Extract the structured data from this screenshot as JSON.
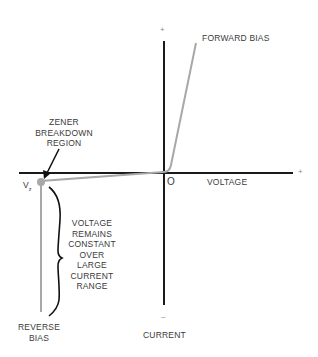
{
  "diagram": {
    "axes": {
      "x_label": "VOLTAGE",
      "y_label": "CURRENT",
      "origin_label": "O",
      "x_positive_sign": "+",
      "y_positive_sign": "+",
      "y_negative_sign": "–"
    },
    "labels": {
      "forward_bias": "FORWARD BIAS",
      "zener_region_line1": "ZENER",
      "zener_region_line2": "BREAKDOWN",
      "zener_region_line3": "REGION",
      "vz_main": "V",
      "vz_sub": "z",
      "constant_line1": "VOLTAGE",
      "constant_line2": "REMAINS",
      "constant_line3": "CONSTANT",
      "constant_line4": "OVER",
      "constant_line5": "LARGE",
      "constant_line6": "CURRENT",
      "constant_line7": "RANGE",
      "reverse_bias_line1": "REVERSE",
      "reverse_bias_line2": "BIAS"
    },
    "colors": {
      "axis": "#1a1a1a",
      "curve": "#a8a8a8",
      "annotation": "#111111",
      "text": "#3a3a3a"
    }
  }
}
